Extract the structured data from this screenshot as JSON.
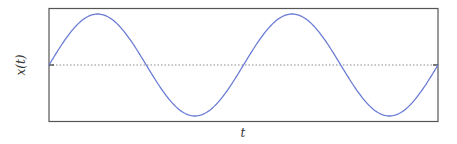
{
  "chart_data": {
    "type": "line",
    "title": "",
    "xlabel": "t",
    "ylabel": "x(t)",
    "grid": false,
    "legend": null,
    "xlim": [
      0,
      2
    ],
    "ylim": [
      -1.1,
      1.1
    ],
    "series": [
      {
        "name": "x(t) = sin(2πt)",
        "color": "#6a7bd4",
        "function": "sin",
        "periods": 2,
        "amplitude": 1,
        "x": [
          0,
          0.25,
          0.5,
          0.75,
          1.0,
          1.25,
          1.5,
          1.75,
          2.0
        ],
        "y": [
          0,
          1,
          0,
          -1,
          0,
          1,
          0,
          -1,
          0
        ]
      }
    ],
    "reference_line": {
      "y": 0,
      "style": "dotted",
      "color": "#888888"
    }
  },
  "colors": {
    "curve": "#6a7bd4",
    "frame": "#555555",
    "zero_line": "#888888",
    "label": "#333333"
  }
}
